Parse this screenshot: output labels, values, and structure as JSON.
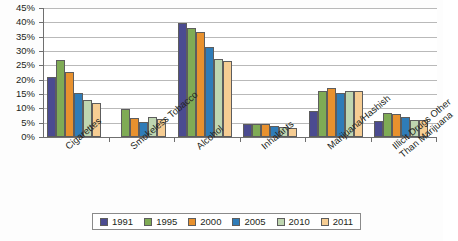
{
  "chart_data": {
    "type": "bar",
    "title": "",
    "xlabel": "",
    "ylabel": "",
    "ylim": [
      0,
      45
    ],
    "ytick_step": 5,
    "grid": true,
    "legend_position": "bottom",
    "categories": [
      "Cigarettes",
      "Smokeless Tobacco",
      "Alcohol",
      "Inhalants",
      "Marijuana/Hashish",
      "Illicit Drugs Other Than Marijuana"
    ],
    "category_lines": [
      [
        "Cigarettes"
      ],
      [
        "Smokeless Tobacco"
      ],
      [
        "Alcohol"
      ],
      [
        "Inhalants"
      ],
      [
        "Marijuana/Hashish"
      ],
      [
        "Illicit Drugs Other",
        "Than Marijuana"
      ]
    ],
    "ytick_labels": [
      "0%",
      "5%",
      "10%",
      "15%",
      "20%",
      "25%",
      "30%",
      "35%",
      "40%",
      "45%"
    ],
    "series": [
      {
        "name": "1991",
        "color": "#4b4b90",
        "values": [
          20.8,
          null,
          39.9,
          4.6,
          9.0,
          5.5
        ]
      },
      {
        "name": "1995",
        "color": "#7fab55",
        "values": [
          26.7,
          9.8,
          38.0,
          4.6,
          16.1,
          8.5
        ]
      },
      {
        "name": "2000",
        "color": "#e8912e",
        "values": [
          22.8,
          6.5,
          36.5,
          4.5,
          17.0,
          8.0
        ]
      },
      {
        "name": "2005",
        "color": "#2f7cb8",
        "values": [
          15.4,
          5.4,
          31.4,
          4.0,
          15.5,
          7.0
        ]
      },
      {
        "name": "2010",
        "color": "#bfd6b0",
        "values": [
          12.9,
          7.0,
          27.1,
          3.6,
          16.0,
          6.1
        ]
      },
      {
        "name": "2011",
        "color": "#f6cd93",
        "values": [
          11.8,
          6.4,
          26.6,
          3.1,
          16.0,
          6.0
        ]
      }
    ]
  },
  "legend": {
    "items": [
      {
        "label": "1991"
      },
      {
        "label": "1995"
      },
      {
        "label": "2000"
      },
      {
        "label": "2005"
      },
      {
        "label": "2010"
      },
      {
        "label": "2011"
      }
    ]
  }
}
